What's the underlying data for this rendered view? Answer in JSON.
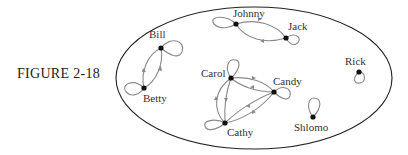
{
  "figure_label": "FIGURE 2-18",
  "colors": {
    "boundary": "#222222",
    "edge": "#8a8a8a",
    "node": "#111111"
  },
  "nodes": [
    {
      "id": "bill",
      "label": "Bill"
    },
    {
      "id": "betty",
      "label": "Betty"
    },
    {
      "id": "johnny",
      "label": "Johnny"
    },
    {
      "id": "jack",
      "label": "Jack"
    },
    {
      "id": "carol",
      "label": "Carol"
    },
    {
      "id": "candy",
      "label": "Candy"
    },
    {
      "id": "cathy",
      "label": "Cathy"
    },
    {
      "id": "rick",
      "label": "Rick"
    },
    {
      "id": "shlomo",
      "label": "Shlomo"
    }
  ],
  "edges": [
    {
      "from": "bill",
      "to": "bill"
    },
    {
      "from": "betty",
      "to": "betty"
    },
    {
      "from": "bill",
      "to": "betty"
    },
    {
      "from": "betty",
      "to": "bill"
    },
    {
      "from": "johnny",
      "to": "johnny"
    },
    {
      "from": "jack",
      "to": "jack"
    },
    {
      "from": "johnny",
      "to": "jack"
    },
    {
      "from": "jack",
      "to": "johnny"
    },
    {
      "from": "carol",
      "to": "carol"
    },
    {
      "from": "candy",
      "to": "candy"
    },
    {
      "from": "cathy",
      "to": "cathy"
    },
    {
      "from": "carol",
      "to": "candy"
    },
    {
      "from": "candy",
      "to": "carol"
    },
    {
      "from": "carol",
      "to": "cathy"
    },
    {
      "from": "cathy",
      "to": "carol"
    },
    {
      "from": "candy",
      "to": "cathy"
    },
    {
      "from": "cathy",
      "to": "candy"
    },
    {
      "from": "rick",
      "to": "rick"
    },
    {
      "from": "shlomo",
      "to": "shlomo"
    }
  ]
}
